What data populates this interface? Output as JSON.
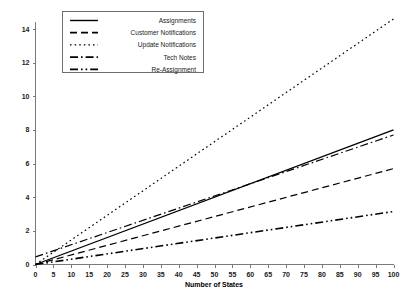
{
  "chart_data": {
    "type": "line",
    "title": "",
    "xlabel": "Number of States",
    "ylabel": "",
    "xlim": [
      0,
      100
    ],
    "ylim": [
      0,
      15
    ],
    "grid": false,
    "legend_position": "top-left",
    "x_ticks": [
      0,
      5,
      10,
      15,
      20,
      25,
      30,
      35,
      40,
      45,
      50,
      55,
      60,
      65,
      70,
      75,
      80,
      85,
      90,
      95,
      100
    ],
    "x_tick_labels": [
      "0",
      "5",
      "10",
      "15",
      "20",
      "25",
      "30",
      "35",
      "40",
      "45",
      "50",
      "55",
      "60",
      "65",
      "70",
      "75",
      "80",
      "85",
      "90",
      "95",
      "100"
    ],
    "y_ticks": [
      0,
      2,
      4,
      6,
      8,
      10,
      12,
      14
    ],
    "y_tick_labels": [
      "0",
      "2",
      "4",
      "6",
      "8",
      "10",
      "12",
      "14"
    ],
    "x": [
      0,
      100
    ],
    "series": [
      {
        "name": "Assignments",
        "style": "solid",
        "dasharray": "",
        "color": "#000000",
        "width": 1.3,
        "values": [
          0.0,
          8.0
        ]
      },
      {
        "name": "Customer Notifications",
        "style": "dashed",
        "dasharray": "7,4",
        "color": "#000000",
        "width": 1.2,
        "values": [
          0.0,
          5.7
        ]
      },
      {
        "name": "Update Notifications",
        "style": "dotted",
        "dasharray": "1.6,3",
        "color": "#000000",
        "width": 1.2,
        "values": [
          0.0,
          14.6
        ]
      },
      {
        "name": "Tech Notes",
        "style": "dash-dot",
        "dasharray": "8,3,1.6,3",
        "color": "#000000",
        "width": 1.2,
        "values": [
          0.45,
          7.7
        ]
      },
      {
        "name": "Re-Assignment",
        "style": "dash-dot-dot",
        "dasharray": "8,3,1.6,3,1.6,3",
        "color": "#000000",
        "width": 1.6,
        "values": [
          0.0,
          3.15
        ]
      }
    ]
  },
  "legend": {
    "items": [
      {
        "label": "Assignments"
      },
      {
        "label": "Customer Notifications"
      },
      {
        "label": "Update Notifications"
      },
      {
        "label": "Tech Notes"
      },
      {
        "label": "Re-Assignment"
      }
    ]
  },
  "colors": {
    "axis": "#7a7a7a",
    "line": "#000000",
    "background": "#ffffff",
    "legend_border": "#6e6e6e"
  }
}
